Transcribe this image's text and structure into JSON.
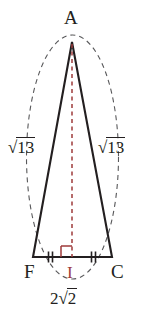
{
  "figure": {
    "type": "isosceles-triangle-with-altitude",
    "background_color": "#ffffff",
    "stroke_color": "#231f20",
    "accent_color": "#9e3b3b",
    "dash_color": "#58585a",
    "vertices": {
      "apex": {
        "name": "A",
        "x": 72,
        "y": 42
      },
      "bottom_left": {
        "name": "F",
        "x": 33,
        "y": 257
      },
      "bottom_right": {
        "name": "C",
        "x": 112,
        "y": 257
      },
      "base_midpoint": {
        "name": "I",
        "x": 72,
        "y": 257
      }
    },
    "labels": {
      "apex": "A",
      "bottom_left": "F",
      "bottom_right": "C",
      "base_midpoint": "I",
      "left_leg_prefix": "√",
      "left_leg_radicand": "13",
      "right_leg_prefix": "√",
      "right_leg_radicand": "13",
      "base_coefficient": "2",
      "base_prefix": "√",
      "base_radicand": "2"
    },
    "markings": {
      "congruent_ticks": "double",
      "tick_segments": [
        "FI",
        "IC"
      ],
      "right_angle_at": "I",
      "right_angle_color": "#9e3b3b",
      "altitude_style": "dashed",
      "altitude_color": "#9e3b3b",
      "circumscribed_curve_style": "dashed",
      "circumscribed_curve_color": "#58585a"
    }
  }
}
